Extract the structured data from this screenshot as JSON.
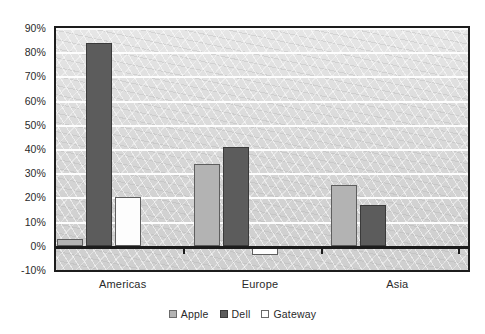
{
  "chart_data": {
    "type": "bar",
    "title": "",
    "subtitle": "",
    "xlabel": "",
    "ylabel": "",
    "categories": [
      "Americas",
      "Europe",
      "Asia"
    ],
    "series": [
      {
        "name": "Apple",
        "values": [
          3,
          34,
          25
        ],
        "color": "#b3b3b3"
      },
      {
        "name": "Dell",
        "values": [
          84,
          41,
          17
        ],
        "color": "#5c5c5c"
      },
      {
        "name": "Gateway",
        "values": [
          20,
          -4,
          -1
        ],
        "color": "#ffffff"
      }
    ],
    "ylim": [
      -10,
      90
    ],
    "ytick_labels": [
      "90%",
      "80%",
      "70%",
      "60%",
      "50%",
      "40%",
      "30%",
      "20%",
      "10%",
      "0%",
      "-10%"
    ],
    "ytick_values": [
      90,
      80,
      70,
      60,
      50,
      40,
      30,
      20,
      10,
      0,
      -10
    ],
    "value_format": "percent",
    "grid": true,
    "gridline_color": "#fdfdfd",
    "legend_position": "bottom",
    "plot_background": "#d7d7d7",
    "frame_color": "#1c1c1c"
  },
  "legend": {
    "items": [
      {
        "label": "Apple",
        "swatch": "apple-swatch"
      },
      {
        "label": "Dell",
        "swatch": "dell-swatch"
      },
      {
        "label": "Gateway",
        "swatch": "gateway-swatch"
      }
    ]
  }
}
